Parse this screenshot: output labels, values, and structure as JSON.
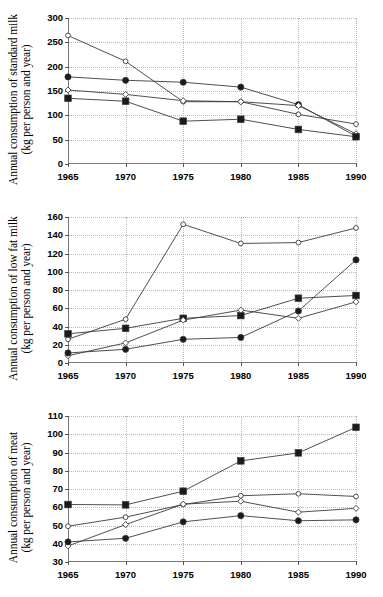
{
  "chart_data": [
    {
      "type": "line",
      "title": "",
      "ylabel_line1": "Annual consumption of standard milk",
      "ylabel_line2": "(kg per person and year)",
      "xlabel": "",
      "categories": [
        "1965",
        "1970",
        "1975",
        "1980",
        "1985",
        "1990"
      ],
      "x": [
        1965,
        1970,
        1975,
        1980,
        1985,
        1990
      ],
      "ylim": [
        0,
        300
      ],
      "yticks": [
        0,
        50,
        100,
        150,
        200,
        250,
        300
      ],
      "grid": true,
      "legend": "none",
      "series": [
        {
          "name": "open-circle",
          "marker": "open-circle",
          "values": [
            264,
            211,
            128,
            128,
            102,
            82
          ]
        },
        {
          "name": "filled-circle",
          "marker": "filled-circle",
          "values": [
            179,
            172,
            168,
            158,
            122,
            57
          ]
        },
        {
          "name": "open-diamond",
          "marker": "open-diamond",
          "values": [
            152,
            143,
            130,
            128,
            120,
            62
          ]
        },
        {
          "name": "filled-square",
          "marker": "filled-square",
          "values": [
            135,
            129,
            88,
            92,
            71,
            56
          ]
        }
      ]
    },
    {
      "type": "line",
      "title": "",
      "ylabel_line1": "Annual consumption of low fat milk",
      "ylabel_line2": "(kg per person and year)",
      "xlabel": "",
      "categories": [
        "1965",
        "1970",
        "1975",
        "1980",
        "1985",
        "1990"
      ],
      "x": [
        1965,
        1970,
        1975,
        1980,
        1985,
        1990
      ],
      "ylim": [
        0,
        160
      ],
      "yticks": [
        0,
        20,
        40,
        60,
        80,
        100,
        120,
        140,
        160
      ],
      "grid": true,
      "legend": "none",
      "series": [
        {
          "name": "open-circle",
          "marker": "open-circle",
          "values": [
            26,
            48,
            152,
            131,
            132,
            148
          ]
        },
        {
          "name": "filled-square",
          "marker": "filled-square",
          "values": [
            32,
            38,
            49,
            52,
            71,
            74
          ]
        },
        {
          "name": "open-diamond",
          "marker": "open-diamond",
          "values": [
            8,
            22,
            47,
            58,
            49,
            67
          ]
        },
        {
          "name": "filled-circle",
          "marker": "filled-circle",
          "values": [
            11,
            15,
            26,
            28,
            57,
            113
          ]
        }
      ]
    },
    {
      "type": "line",
      "title": "",
      "ylabel_line1": "Annual consumption of meat",
      "ylabel_line2": "(kg per person and year)",
      "xlabel": "",
      "categories": [
        "1965",
        "1970",
        "1975",
        "1980",
        "1985",
        "1990"
      ],
      "x": [
        1965,
        1970,
        1975,
        1980,
        1985,
        1990
      ],
      "ylim": [
        30,
        110
      ],
      "yticks": [
        30,
        40,
        50,
        60,
        70,
        80,
        90,
        100,
        110
      ],
      "grid": true,
      "legend": "none",
      "series": [
        {
          "name": "filled-square",
          "marker": "filled-square",
          "values": [
            61.5,
            61.3,
            68.8,
            85.4,
            89.8,
            103.8
          ]
        },
        {
          "name": "open-circle",
          "marker": "open-circle",
          "values": [
            49.6,
            54.6,
            61.5,
            66.3,
            67.4,
            65.9
          ]
        },
        {
          "name": "open-diamond",
          "marker": "open-diamond",
          "values": [
            38.8,
            50.5,
            61.7,
            63.3,
            57.3,
            59.4
          ]
        },
        {
          "name": "filled-circle",
          "marker": "filled-circle",
          "values": [
            41.0,
            43.0,
            52.0,
            55.4,
            52.6,
            53.1
          ]
        }
      ]
    }
  ],
  "style": {
    "line_color": "#3b3b3b",
    "grid_color": "#b9b9b9",
    "axis_color": "#7a7a7a",
    "marker_fill": "#1a1a1a",
    "marker_open_fill": "#ffffff"
  }
}
